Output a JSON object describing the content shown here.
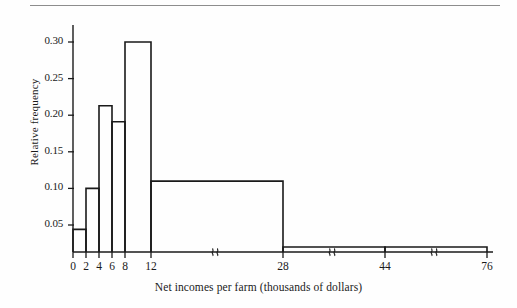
{
  "figure": {
    "background_color": "#fefefe",
    "ink_color": "#1a1a1a",
    "rule_color": "#8d8d8d"
  },
  "chart_data": {
    "type": "bar",
    "subtype": "histogram",
    "title": "",
    "xlabel": "Net incomes per farm (thousands of dollars)",
    "ylabel": "Relative frequency",
    "grid": false,
    "legend": null,
    "xlim": [
      0,
      76
    ],
    "ylim": [
      0,
      0.32
    ],
    "x_axis_has_breaks": true,
    "x_break_marks": [
      {
        "name": "break-12-28",
        "between": [
          12,
          28
        ],
        "glyph": "}}"
      },
      {
        "name": "break-28-44",
        "between": [
          28,
          44
        ],
        "glyph": "}}"
      },
      {
        "name": "break-44-76",
        "between": [
          44,
          76
        ],
        "glyph": "}}"
      }
    ],
    "xticks": [
      0,
      2,
      4,
      6,
      8,
      12,
      28,
      44,
      76
    ],
    "xticklabels": [
      "0",
      "2",
      "4",
      "6",
      "8",
      "12",
      "28",
      "44",
      "76"
    ],
    "yticks": [
      0.05,
      0.1,
      0.15,
      0.2,
      0.25,
      0.3
    ],
    "yticklabels": [
      "0.05",
      "0.10",
      "0.15",
      "0.20",
      "0.25",
      "0.30"
    ],
    "bin_edges": [
      0,
      2,
      4,
      6,
      8,
      12,
      28,
      44,
      76
    ],
    "bin_labels": [
      "0-2",
      "2-4",
      "4-6",
      "6-8",
      "8-12",
      "12-28",
      "28-44",
      "44-76"
    ],
    "values": [
      0.044,
      0.1,
      0.213,
      0.191,
      0.3,
      0.11,
      0.02,
      0.02
    ],
    "bars": [
      {
        "label": "0-2",
        "x0": 0,
        "x1": 2,
        "value": 0.044
      },
      {
        "label": "2-4",
        "x0": 2,
        "x1": 4,
        "value": 0.1
      },
      {
        "label": "4-6",
        "x0": 4,
        "x1": 6,
        "value": 0.213
      },
      {
        "label": "6-8",
        "x0": 6,
        "x1": 8,
        "value": 0.191
      },
      {
        "label": "8-12",
        "x0": 8,
        "x1": 12,
        "value": 0.3
      },
      {
        "label": "12-28",
        "x0": 12,
        "x1": 28,
        "value": 0.11
      },
      {
        "label": "28-44",
        "x0": 28,
        "x1": 44,
        "value": 0.02
      },
      {
        "label": "44-76",
        "x0": 44,
        "x1": 76,
        "value": 0.02
      }
    ]
  }
}
